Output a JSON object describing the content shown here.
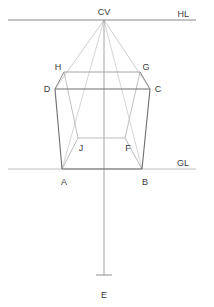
{
  "diagram": {
    "canvas": {
      "width": 214,
      "height": 307
    },
    "colors": {
      "horizon_line": "#8a8a8a",
      "ground_line": "#c0c0c0",
      "front_face": "#6e6e6e",
      "back_face": "#aeaeae",
      "convergence_line": "#b8b8b8",
      "center_axis": "#9a9a9a",
      "label_text": "#3a3a3a",
      "background": "#ffffff"
    },
    "lines": {
      "horizon": {
        "label": "HL",
        "y": 20,
        "x1": 8,
        "x2": 196
      },
      "ground": {
        "label": "GL",
        "y": 169,
        "x1": 8,
        "x2": 196
      },
      "center_axis": {
        "x": 104,
        "y1": 20,
        "y2": 275
      },
      "station_tick": {
        "x1": 96,
        "x2": 112,
        "y": 275
      }
    },
    "points": [
      {
        "name": "CV",
        "label": "CV",
        "x": 104,
        "y": 20,
        "label_x": 104,
        "label_y": 14,
        "anchor": "middle"
      },
      {
        "name": "H",
        "label": "H",
        "x": 64,
        "y": 72,
        "label_x": 58,
        "label_y": 70,
        "anchor": "middle"
      },
      {
        "name": "G",
        "label": "G",
        "x": 140,
        "y": 72,
        "label_x": 146,
        "label_y": 70,
        "anchor": "middle"
      },
      {
        "name": "D",
        "label": "D",
        "x": 55,
        "y": 89,
        "label_x": 48,
        "label_y": 92,
        "anchor": "middle"
      },
      {
        "name": "C",
        "label": "C",
        "x": 150,
        "y": 89,
        "label_x": 157,
        "label_y": 92,
        "anchor": "middle"
      },
      {
        "name": "J",
        "label": "J",
        "x": 78,
        "y": 138,
        "label_x": 80,
        "label_y": 150,
        "anchor": "middle"
      },
      {
        "name": "F",
        "label": "F",
        "x": 125,
        "y": 138,
        "label_x": 128,
        "label_y": 150,
        "anchor": "middle"
      },
      {
        "name": "A",
        "label": "A",
        "x": 62,
        "y": 169,
        "label_x": 64,
        "label_y": 184,
        "anchor": "middle"
      },
      {
        "name": "B",
        "label": "B",
        "x": 142,
        "y": 169,
        "label_x": 145,
        "label_y": 184,
        "anchor": "middle"
      },
      {
        "name": "E",
        "label": "E",
        "x": 104,
        "y": 275,
        "label_x": 104,
        "label_y": 297,
        "anchor": "middle"
      }
    ],
    "front_face_path": "M 55 89 L 150 89 L 142 169 L 62 169 Z",
    "back_face_path": "M 64 72 L 140 72 L 125 138 L 78 138 Z",
    "connector_edges": [
      {
        "name": "edge-D-H",
        "x1": 55,
        "y1": 89,
        "x2": 64,
        "y2": 72
      },
      {
        "name": "edge-C-G",
        "x1": 150,
        "y1": 89,
        "x2": 140,
        "y2": 72
      },
      {
        "name": "edge-A-J",
        "x1": 62,
        "y1": 169,
        "x2": 78,
        "y2": 138
      },
      {
        "name": "edge-B-F",
        "x1": 142,
        "y1": 169,
        "x2": 125,
        "y2": 138
      }
    ],
    "convergence_rays": [
      {
        "name": "ray-cv-A",
        "x1": 104,
        "y1": 20,
        "x2": 62,
        "y2": 169
      },
      {
        "name": "ray-cv-B",
        "x1": 104,
        "y1": 20,
        "x2": 142,
        "y2": 169
      },
      {
        "name": "ray-cv-D",
        "x1": 104,
        "y1": 20,
        "x2": 55,
        "y2": 89
      },
      {
        "name": "ray-cv-C",
        "x1": 104,
        "y1": 20,
        "x2": 150,
        "y2": 89
      }
    ]
  }
}
